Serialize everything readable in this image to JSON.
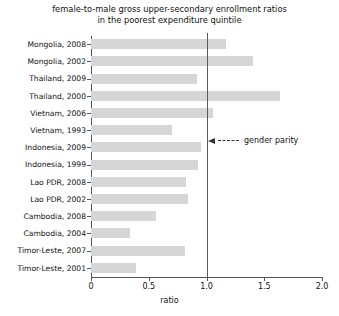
{
  "chart_data": {
    "type": "bar",
    "orientation": "horizontal",
    "title": "female-to-male gross upper-secondary enrollment ratios in the poorest expenditure quintile",
    "title_lines": [
      "female-to-male gross upper-secondary enrollment ratios",
      "in the poorest expenditure quintile"
    ],
    "xlabel": "ratio",
    "ylabel": "",
    "xlim": [
      0,
      2.0
    ],
    "xticks": [
      0,
      0.5,
      1.0,
      1.5,
      2.0
    ],
    "xtick_labels": [
      "0",
      "0.5",
      "1.0",
      "1.5",
      "2.0"
    ],
    "grid": false,
    "legend": false,
    "bar_color": "#d6d6d6",
    "reference_line": {
      "value": 1.0,
      "label": "gender parity",
      "color": "#5a5a5a"
    },
    "annotations": [
      {
        "text": "gender parity",
        "points_to": 1.0,
        "style": "dashed-arrow-left"
      }
    ],
    "categories": [
      "Mongolia, 2008",
      "Mongolia, 2002",
      "Thailand, 2009",
      "Thailand, 2000",
      "Vietnam, 2006",
      "Vietnam, 1993",
      "Indonesia, 2009",
      "Indonesia, 1999",
      "Lao PDR, 2008",
      "Lao PDR, 2002",
      "Cambodia, 2008",
      "Cambodia, 2004",
      "Timor-Leste, 2007",
      "Timor-Leste, 2001"
    ],
    "values": [
      1.17,
      1.4,
      0.92,
      1.64,
      1.06,
      0.7,
      0.95,
      0.93,
      0.82,
      0.84,
      0.56,
      0.34,
      0.81,
      0.39
    ]
  }
}
